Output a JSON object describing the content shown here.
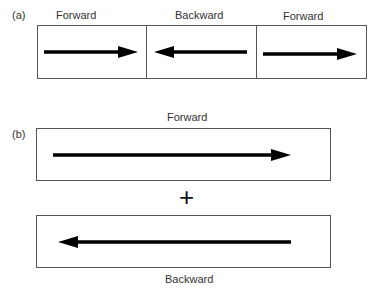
{
  "panel_a": {
    "label": "(a)",
    "segments": [
      {
        "title": "Forward",
        "direction": "right"
      },
      {
        "title": "Backward",
        "direction": "left"
      },
      {
        "title": "Forward",
        "direction": "right"
      }
    ]
  },
  "panel_b": {
    "label": "(b)",
    "top": {
      "title": "Forward",
      "direction": "right"
    },
    "operator": "+",
    "bottom": {
      "title": "Backward",
      "direction": "left"
    }
  }
}
